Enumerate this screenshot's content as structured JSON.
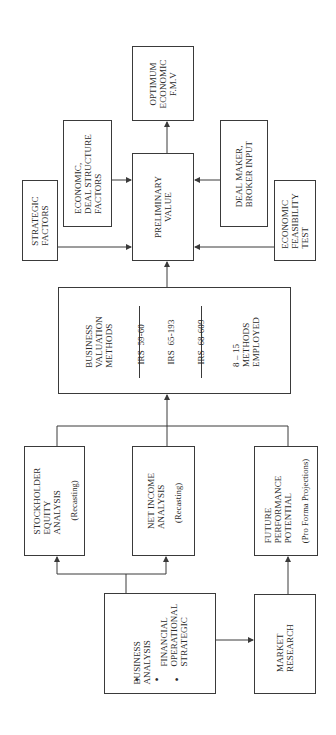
{
  "diagram": {
    "orientation": "rotated-90-ccw",
    "nodes": {
      "optimum": {
        "lines": [
          "OPTIMUM",
          "ECONOMIC",
          "F.M.V"
        ]
      },
      "economic_deal": {
        "lines": [
          "ECONOMIC,",
          "DEAL STRUCTURE",
          "FACTORS"
        ]
      },
      "strategic": {
        "lines": [
          "STRATEGIC",
          "FACTORS"
        ]
      },
      "preliminary": {
        "lines": [
          "PRELIMINARY",
          "VALUE"
        ]
      },
      "deal_maker": {
        "lines": [
          "DEAL MAKER,",
          "BROKER INPUT"
        ]
      },
      "economic_feasibility": {
        "lines": [
          "ECONOMIC",
          "FEASIBILITY",
          "TEST"
        ]
      },
      "valuation_methods": {
        "title_lines": [
          "BUSINESS",
          "VALUATION",
          "METHODS"
        ],
        "irs_lines": [
          "IRS  59-60",
          "IRS  65-193",
          "IRS  68-609"
        ],
        "count_lines": [
          "8 – 15",
          "METHODS",
          "EMPLOYED"
        ]
      },
      "stockholder": {
        "lines": [
          "STOCKHOLDER",
          "EQUITY",
          "ANALYSIS"
        ],
        "note": "(Recasting)"
      },
      "net_income": {
        "lines": [
          "NET INCOME",
          "ANALYSIS"
        ],
        "note": "(Recasting)"
      },
      "future": {
        "lines": [
          "FUTURE",
          "PERFORMANCE",
          "POTENTIAL"
        ],
        "note": "(Pro Forma Projections)"
      },
      "business_analysis": {
        "title_lines": [
          "BUSINESS",
          "ANALYSIS"
        ],
        "item_lines": [
          "FINANCIAL",
          "OPERATIONAL",
          "STRATEGIC"
        ],
        "ellipsis": "• • •"
      },
      "market_research": {
        "lines": [
          "MARKET",
          "RESEARCH"
        ]
      }
    },
    "edges": [
      {
        "from": "preliminary",
        "to": "optimum"
      },
      {
        "from": "economic_deal",
        "to": "preliminary"
      },
      {
        "from": "strategic",
        "to": "preliminary"
      },
      {
        "from": "deal_maker",
        "to": "preliminary"
      },
      {
        "from": "economic_feasibility",
        "to": "preliminary"
      },
      {
        "from": "valuation_methods",
        "to": "preliminary"
      },
      {
        "from": "stockholder",
        "to": "valuation_methods"
      },
      {
        "from": "net_income",
        "to": "valuation_methods"
      },
      {
        "from": "future",
        "to": "valuation_methods"
      },
      {
        "from": "business_analysis",
        "to": "stockholder"
      },
      {
        "from": "business_analysis",
        "to": "net_income"
      },
      {
        "from": "business_analysis",
        "to": "market_research"
      },
      {
        "from": "market_research",
        "to": "future"
      }
    ],
    "colors": {
      "line": "#3a3a3a",
      "background": "#ffffff",
      "text": "#2a2a2a"
    }
  }
}
